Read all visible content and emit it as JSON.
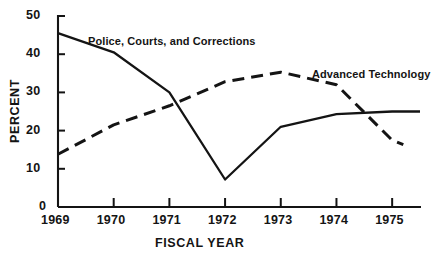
{
  "chart_data": {
    "type": "line",
    "title": "",
    "xlabel": "FISCAL YEAR",
    "ylabel": "PERCENT",
    "categories": [
      "1969",
      "1970",
      "1971",
      "1972",
      "1973",
      "1974",
      "1975"
    ],
    "x": [
      1969,
      1970,
      1971,
      1972,
      1973,
      1974,
      1975
    ],
    "xlim": [
      1969,
      1975.5
    ],
    "ylim": [
      0,
      50
    ],
    "yticks": [
      0,
      10,
      20,
      30,
      40,
      50
    ],
    "ytick_labels": [
      "0",
      "10",
      "20",
      "30",
      "40",
      "50"
    ],
    "xticks": [
      1969,
      1970,
      1971,
      1972,
      1973,
      1974,
      1975
    ],
    "grid": false,
    "legend": "inline-annotations",
    "series": [
      {
        "name": "Police, Courts, and Corrections",
        "style": "solid",
        "color": "#141414",
        "x": [
          1969,
          1970,
          1971,
          1972,
          1973,
          1974,
          1975,
          1975.5
        ],
        "values": [
          45.5,
          40.5,
          30.0,
          7.2,
          21.0,
          24.3,
          25.0,
          25.0
        ]
      },
      {
        "name": "Advanced Technology",
        "style": "dashed",
        "color": "#141414",
        "x": [
          1969,
          1970,
          1971,
          1972,
          1973,
          1974,
          1975,
          1975.2
        ],
        "values": [
          13.8,
          21.5,
          26.5,
          32.8,
          35.3,
          32.0,
          17.5,
          16.3
        ]
      }
    ]
  },
  "axis": {
    "y_title": "PERCENT",
    "x_title": "FISCAL YEAR",
    "y_tick_labels": [
      "50",
      "40",
      "30",
      "20",
      "10",
      "0"
    ],
    "x_tick_labels": [
      "1969",
      "1970",
      "1971",
      "1972",
      "1973",
      "1974",
      "1975"
    ]
  },
  "annotations": {
    "series1_label": "Police, Courts, and Corrections",
    "series2_label": "Advanced Technology"
  },
  "colors": {
    "ink": "#141414",
    "background": "#ffffff"
  }
}
